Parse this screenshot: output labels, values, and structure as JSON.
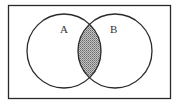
{
  "diagram": {
    "type": "venn",
    "universe": {
      "x": 8.5,
      "y": 5.5,
      "width": 162,
      "height": 93
    },
    "sets": [
      {
        "label": "A",
        "cx": 64,
        "cy": 51,
        "r": 37,
        "label_x": 60,
        "label_y": 33
      },
      {
        "label": "B",
        "cx": 115,
        "cy": 51,
        "r": 37,
        "label_x": 110,
        "label_y": 33
      }
    ],
    "shaded_region": "A ∩ B",
    "colors": {
      "stroke": "#2a2a2a",
      "shade": "#b8b8b8",
      "shade_dot": "#6a6a6a",
      "background": "#ffffff"
    }
  }
}
